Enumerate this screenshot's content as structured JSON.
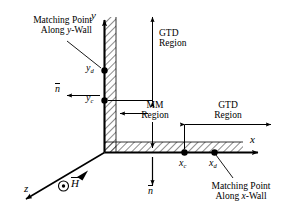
{
  "figure": {
    "type": "electromagnetics-corner-diagram"
  },
  "axes": {
    "y_label": "y",
    "x_label": "x",
    "z_label": "z"
  },
  "points": {
    "y_d": {
      "label": "y",
      "sub": "d"
    },
    "y_c": {
      "label": "y",
      "sub": "c"
    },
    "x_c": {
      "label": "x",
      "sub": "c"
    },
    "x_d": {
      "label": "x",
      "sub": "d"
    }
  },
  "annotations": {
    "matching_y_line1": "Matching Point",
    "matching_y_line2": "Along y-Wall",
    "matching_y_italic": "y",
    "matching_x_line1": "Matching Point",
    "matching_x_line2": "Along x-Wall",
    "matching_x_italic": "x",
    "gtd_top_line1": "GTD",
    "gtd_top_line2": "Region",
    "gtd_right_line1": "GTD",
    "gtd_right_line2": "Region",
    "mm_line1": "MM",
    "mm_line2": "Region",
    "normal_y_wall": "n",
    "normal_x_wall": "n",
    "field_symbol": "H",
    "field_marker": "circle-dot-out-of-page"
  },
  "colors": {
    "stroke": "#000000",
    "background": "#ffffff",
    "hatch": "#000000"
  }
}
